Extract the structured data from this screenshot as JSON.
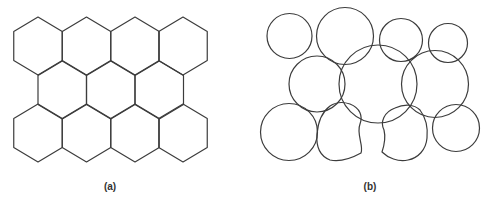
{
  "figure": {
    "panels": [
      {
        "id": "a",
        "label": "(a)",
        "description": "Regular hexagonal tiling (honeycomb), 3 rows: 4 + 3 + 4 hexagons",
        "label_pos": [
          110,
          190
        ],
        "hexagon": {
          "half_width": 24.25,
          "rise": 14.5,
          "side": 29
        },
        "rows": [
          {
            "top_y": 17,
            "centers_x": [
              38,
              86.5,
              135,
              183
            ]
          },
          {
            "top_y": 61,
            "centers_x": [
              62.25,
              110.75,
              159.25
            ]
          },
          {
            "top_y": 104,
            "centers_x": [
              38,
              86.5,
              135,
              183
            ]
          }
        ]
      },
      {
        "id": "b",
        "label": "(b)",
        "description": "Irregular overlapping circles (cell-like shapes) with two deformed cells at bottom center",
        "label_pos": [
          370,
          190
        ],
        "circles": [
          {
            "cx": 289.5,
            "cy": 36,
            "r": 22.5
          },
          {
            "cx": 345,
            "cy": 36,
            "r": 28.5
          },
          {
            "cx": 401,
            "cy": 40,
            "r": 21.5
          },
          {
            "cx": 448,
            "cy": 43,
            "r": 19.5
          },
          {
            "cx": 317,
            "cy": 84,
            "r": 28
          },
          {
            "cx": 378,
            "cy": 84,
            "r": 39
          },
          {
            "cx": 435,
            "cy": 84,
            "r": 33.5
          },
          {
            "cx": 289,
            "cy": 132,
            "r": 28.5
          },
          {
            "cx": 456,
            "cy": 128,
            "r": 23.5
          }
        ],
        "deformed_shapes": [
          "M 350 104 C 360 108, 363 116, 360 124 C 356 134, 364 146, 361 153 C 352 158, 340 162, 330 160 C 320 156, 316 146, 317 134 C 318 122, 322 112, 330 106 C 336 102, 344 102, 350 104 Z",
          "M 395 108 C 404 104, 414 104, 420 110 C 426 118, 428 128, 427 138 C 426 150, 418 158, 408 160 C 398 162, 388 158, 382 152 C 384 146, 386 138, 384 130 C 380 122, 384 112, 395 108 Z"
        ]
      }
    ]
  }
}
